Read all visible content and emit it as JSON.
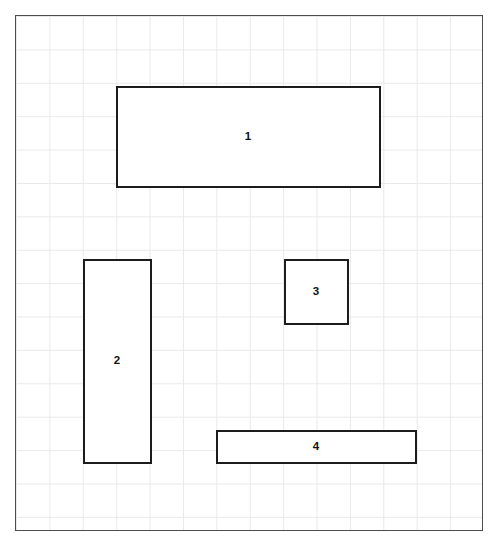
{
  "diagram": {
    "background_color": "#ffffff",
    "sheet": {
      "name": "graph-paper-sheet",
      "x": 15,
      "y": 15,
      "width": 468,
      "height": 516,
      "border_color": "#4d4d4d",
      "border_width": 1.5,
      "fill_color": "#ffffff",
      "grid": {
        "visible": true,
        "cell_size": 33.4,
        "line_color": "#e9e9e9",
        "line_width": 1,
        "columns": 14,
        "rows": 15
      }
    },
    "shape_style": {
      "stroke_color": "#1c1c1c",
      "stroke_width": 2.5,
      "fill_color": "#ffffff",
      "label_color": "#111111",
      "label_size": 11.5,
      "label_weight": "bold"
    },
    "shapes": [
      {
        "label": "1",
        "name": "rectangle-1",
        "x": 116,
        "y": 86,
        "width": 265,
        "height": 102,
        "grid_cells_wide": 8,
        "grid_cells_tall": 3,
        "orientation": "horizontal"
      },
      {
        "label": "2",
        "name": "rectangle-2",
        "x": 83,
        "y": 259,
        "width": 69,
        "height": 205,
        "grid_cells_wide": 2,
        "grid_cells_tall": 6,
        "orientation": "vertical"
      },
      {
        "label": "3",
        "name": "rectangle-3",
        "x": 284,
        "y": 259,
        "width": 65,
        "height": 66,
        "grid_cells_wide": 2,
        "grid_cells_tall": 2,
        "orientation": "square"
      },
      {
        "label": "4",
        "name": "rectangle-4",
        "x": 216,
        "y": 430,
        "width": 201,
        "height": 34,
        "grid_cells_wide": 6,
        "grid_cells_tall": 1,
        "orientation": "horizontal"
      }
    ]
  }
}
